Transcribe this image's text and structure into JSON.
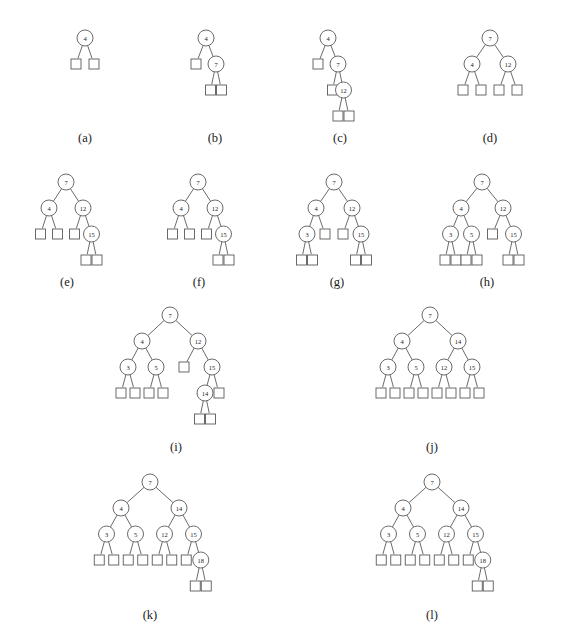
{
  "figure": {
    "background_color": "#ffffff",
    "stroke_color": "#5a5a5a",
    "text_color": "#1a1a1a",
    "node_fill": "#ffffff"
  },
  "style": {
    "node_radius": 8,
    "leaf_size": 10,
    "level_gap": 26,
    "font_size_node": 6.5
  },
  "trees": [
    {
      "id": "a",
      "caption": "(a)",
      "origin": {
        "x": 22,
        "y": 28
      },
      "caption_pos": {
        "x": 85,
        "y": 131
      },
      "width": 130,
      "height": 96,
      "root_offset": 63,
      "spread": 18,
      "root": {
        "value": "4",
        "children": [
          {
            "leaf": true
          },
          {
            "leaf": true
          }
        ]
      }
    },
    {
      "id": "b",
      "caption": "(b)",
      "origin": {
        "x": 160,
        "y": 28
      },
      "caption_pos": {
        "x": 215,
        "y": 131
      },
      "width": 120,
      "height": 96,
      "root_offset": 46,
      "spread": 20,
      "root": {
        "value": "4",
        "children": [
          {
            "leaf": true
          },
          {
            "value": "7",
            "children": [
              {
                "leaf": true
              },
              {
                "leaf": true
              }
            ]
          }
        ]
      }
    },
    {
      "id": "c",
      "caption": "(c)",
      "origin": {
        "x": 292,
        "y": 28
      },
      "caption_pos": {
        "x": 340,
        "y": 131
      },
      "width": 120,
      "height": 110,
      "root_offset": 36,
      "spread": 20,
      "root": {
        "value": "4",
        "children": [
          {
            "leaf": true
          },
          {
            "value": "7",
            "children": [
              {
                "leaf": true
              },
              {
                "value": "12",
                "children": [
                  {
                    "leaf": true
                  },
                  {
                    "leaf": true
                  }
                ]
              }
            ]
          }
        ]
      }
    },
    {
      "id": "d",
      "caption": "(d)",
      "origin": {
        "x": 420,
        "y": 28
      },
      "caption_pos": {
        "x": 490,
        "y": 131
      },
      "width": 140,
      "height": 96,
      "root_offset": 70,
      "spread": 36,
      "root": {
        "value": "7",
        "children": [
          {
            "value": "4",
            "children": [
              {
                "leaf": true
              },
              {
                "leaf": true
              }
            ]
          },
          {
            "value": "12",
            "children": [
              {
                "leaf": true
              },
              {
                "leaf": true
              }
            ]
          }
        ]
      }
    },
    {
      "id": "e",
      "caption": "(e)",
      "origin": {
        "x": 8,
        "y": 172
      },
      "caption_pos": {
        "x": 67,
        "y": 275
      },
      "width": 125,
      "height": 104,
      "root_offset": 58,
      "spread": 34,
      "root": {
        "value": "7",
        "children": [
          {
            "value": "4",
            "children": [
              {
                "leaf": true
              },
              {
                "leaf": true
              }
            ]
          },
          {
            "value": "12",
            "children": [
              {
                "leaf": true
              },
              {
                "value": "15",
                "children": [
                  {
                    "leaf": true
                  },
                  {
                    "leaf": true
                  }
                ]
              }
            ]
          }
        ]
      }
    },
    {
      "id": "f",
      "caption": "(f)",
      "origin": {
        "x": 140,
        "y": 172
      },
      "caption_pos": {
        "x": 199,
        "y": 275
      },
      "width": 125,
      "height": 104,
      "root_offset": 58,
      "spread": 34,
      "root": {
        "value": "7",
        "children": [
          {
            "value": "4",
            "children": [
              {
                "leaf": true
              },
              {
                "leaf": true
              }
            ]
          },
          {
            "value": "12",
            "children": [
              {
                "leaf": true
              },
              {
                "value": "15",
                "children": [
                  {
                    "leaf": true
                  },
                  {
                    "leaf": true
                  }
                ]
              }
            ]
          }
        ]
      }
    },
    {
      "id": "g",
      "caption": "(g)",
      "origin": {
        "x": 272,
        "y": 172
      },
      "caption_pos": {
        "x": 337,
        "y": 275
      },
      "width": 130,
      "height": 104,
      "root_offset": 62,
      "spread": 36,
      "root": {
        "value": "7",
        "children": [
          {
            "value": "4",
            "children": [
              {
                "value": "3",
                "children": [
                  {
                    "leaf": true
                  },
                  {
                    "leaf": true
                  }
                ]
              },
              {
                "leaf": true
              }
            ]
          },
          {
            "value": "12",
            "children": [
              {
                "leaf": true
              },
              {
                "value": "15",
                "children": [
                  {
                    "leaf": true
                  },
                  {
                    "leaf": true
                  }
                ]
              }
            ]
          }
        ]
      }
    },
    {
      "id": "h",
      "caption": "(h)",
      "origin": {
        "x": 410,
        "y": 172
      },
      "caption_pos": {
        "x": 487,
        "y": 275
      },
      "width": 150,
      "height": 104,
      "root_offset": 72,
      "spread": 42,
      "root": {
        "value": "7",
        "children": [
          {
            "value": "4",
            "children": [
              {
                "value": "3",
                "children": [
                  {
                    "leaf": true
                  },
                  {
                    "leaf": true
                  }
                ]
              },
              {
                "value": "5",
                "children": [
                  {
                    "leaf": true
                  },
                  {
                    "leaf": true
                  }
                ]
              }
            ]
          },
          {
            "value": "12",
            "children": [
              {
                "leaf": true
              },
              {
                "value": "15",
                "children": [
                  {
                    "leaf": true
                  },
                  {
                    "leaf": true
                  }
                ]
              }
            ]
          }
        ]
      }
    },
    {
      "id": "i",
      "caption": "(i)",
      "origin": {
        "x": 62,
        "y": 305
      },
      "caption_pos": {
        "x": 176,
        "y": 440
      },
      "width": 215,
      "height": 130,
      "root_offset": 108,
      "spread": 56,
      "root": {
        "value": "7",
        "children": [
          {
            "value": "4",
            "children": [
              {
                "value": "3",
                "children": [
                  {
                    "leaf": true
                  },
                  {
                    "leaf": true
                  }
                ]
              },
              {
                "value": "5",
                "children": [
                  {
                    "leaf": true
                  },
                  {
                    "leaf": true
                  }
                ]
              }
            ]
          },
          {
            "value": "12",
            "children": [
              {
                "leaf": true
              },
              {
                "value": "15",
                "children": [
                  {
                    "value": "14",
                    "children": [
                      {
                        "leaf": true
                      },
                      {
                        "leaf": true
                      }
                    ]
                  },
                  {
                    "leaf": true
                  }
                ]
              }
            ]
          }
        ]
      }
    },
    {
      "id": "j",
      "caption": "(j)",
      "origin": {
        "x": 318,
        "y": 305
      },
      "caption_pos": {
        "x": 432,
        "y": 440
      },
      "width": 225,
      "height": 110,
      "root_offset": 112,
      "spread": 56,
      "root": {
        "value": "7",
        "children": [
          {
            "value": "4",
            "children": [
              {
                "value": "3",
                "children": [
                  {
                    "leaf": true
                  },
                  {
                    "leaf": true
                  }
                ]
              },
              {
                "value": "5",
                "children": [
                  {
                    "leaf": true
                  },
                  {
                    "leaf": true
                  }
                ]
              }
            ]
          },
          {
            "value": "14",
            "children": [
              {
                "value": "12",
                "children": [
                  {
                    "leaf": true
                  },
                  {
                    "leaf": true
                  }
                ]
              },
              {
                "value": "15",
                "children": [
                  {
                    "leaf": true
                  },
                  {
                    "leaf": true
                  }
                ]
              }
            ]
          }
        ]
      }
    },
    {
      "id": "k",
      "caption": "(k)",
      "origin": {
        "x": 36,
        "y": 472
      },
      "caption_pos": {
        "x": 150,
        "y": 608
      },
      "width": 228,
      "height": 130,
      "root_offset": 114,
      "spread": 58,
      "root": {
        "value": "7",
        "children": [
          {
            "value": "4",
            "children": [
              {
                "value": "3",
                "children": [
                  {
                    "leaf": true
                  },
                  {
                    "leaf": true
                  }
                ]
              },
              {
                "value": "5",
                "children": [
                  {
                    "leaf": true
                  },
                  {
                    "leaf": true
                  }
                ]
              }
            ]
          },
          {
            "value": "14",
            "children": [
              {
                "value": "12",
                "children": [
                  {
                    "leaf": true
                  },
                  {
                    "leaf": true
                  }
                ]
              },
              {
                "value": "15",
                "children": [
                  {
                    "leaf": true
                  },
                  {
                    "value": "18",
                    "children": [
                      {
                        "leaf": true
                      },
                      {
                        "leaf": true
                      }
                    ]
                  }
                ]
              }
            ]
          }
        ]
      }
    },
    {
      "id": "l",
      "caption": "(l)",
      "origin": {
        "x": 318,
        "y": 472
      },
      "caption_pos": {
        "x": 432,
        "y": 608
      },
      "width": 228,
      "height": 130,
      "root_offset": 114,
      "spread": 58,
      "root": {
        "value": "7",
        "children": [
          {
            "value": "4",
            "children": [
              {
                "value": "3",
                "children": [
                  {
                    "leaf": true
                  },
                  {
                    "leaf": true
                  }
                ]
              },
              {
                "value": "5",
                "children": [
                  {
                    "leaf": true
                  },
                  {
                    "leaf": true
                  }
                ]
              }
            ]
          },
          {
            "value": "14",
            "children": [
              {
                "value": "12",
                "children": [
                  {
                    "leaf": true
                  },
                  {
                    "leaf": true
                  }
                ]
              },
              {
                "value": "15",
                "children": [
                  {
                    "leaf": true
                  },
                  {
                    "value": "18",
                    "children": [
                      {
                        "leaf": true
                      },
                      {
                        "leaf": true
                      }
                    ]
                  }
                ]
              }
            ]
          }
        ]
      }
    }
  ]
}
